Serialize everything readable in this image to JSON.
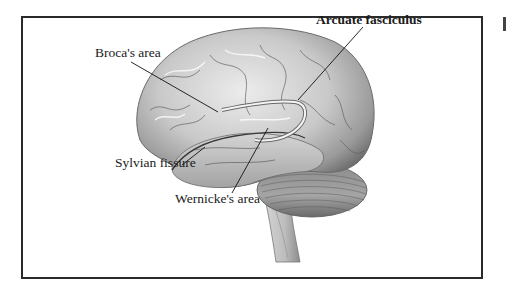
{
  "figure": {
    "labels": {
      "arcuate": "Arcuate fasciculus",
      "broca": "Broca's area",
      "sylvian": "Sylvian fissure",
      "wernicke": "Wernicke's area"
    },
    "colors": {
      "frame": "#2a2a2a",
      "brain_light": "#e4e4e4",
      "brain_mid": "#b5b5b5",
      "brain_dark": "#7a7a7a",
      "leader_line": "#111111"
    }
  }
}
